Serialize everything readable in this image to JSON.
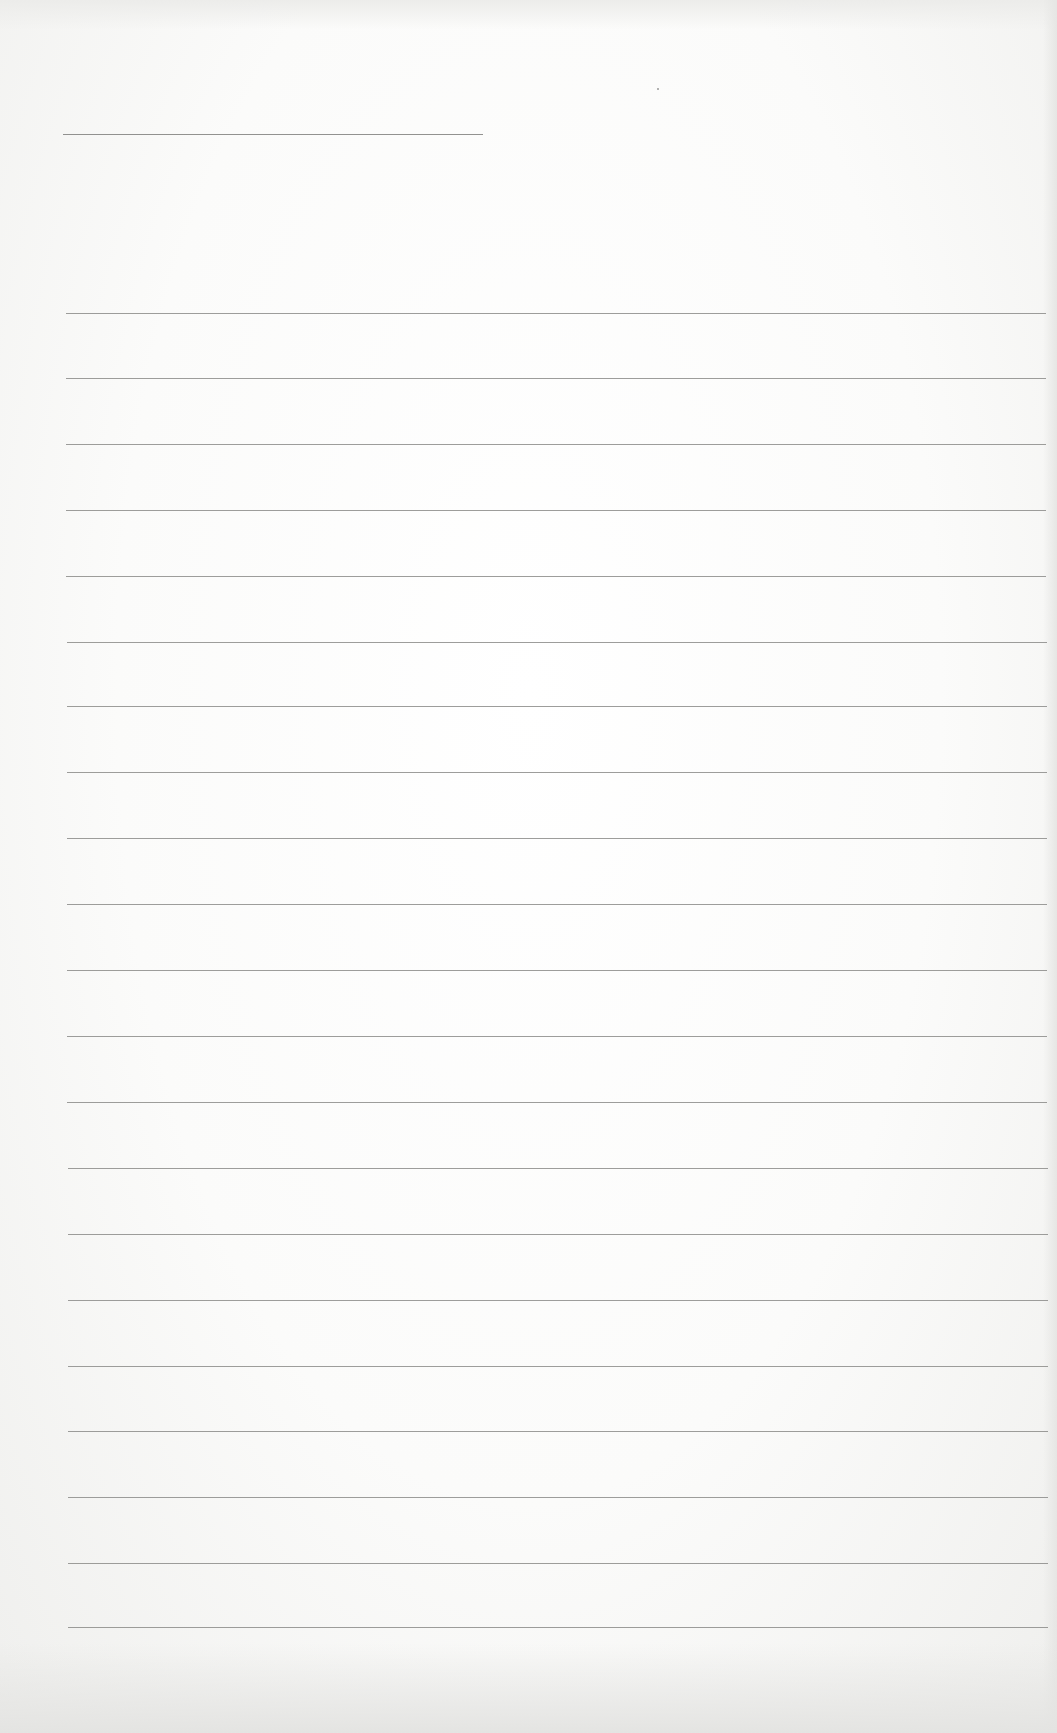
{
  "page": {
    "type": "blank ruled paper",
    "background_color": "#fbfbfa",
    "rule_color": "#8c8c8a"
  },
  "header_line": {
    "x1": 63,
    "x2": 483,
    "y": 134
  },
  "ruled_lines": {
    "x1": 66,
    "x2": 1046,
    "y_positions": [
      313,
      378,
      444,
      510,
      576,
      642,
      706,
      772,
      838,
      904,
      970,
      1036,
      1102,
      1168,
      1234,
      1300,
      1366,
      1431,
      1497,
      1563,
      1627
    ]
  },
  "text_content": []
}
